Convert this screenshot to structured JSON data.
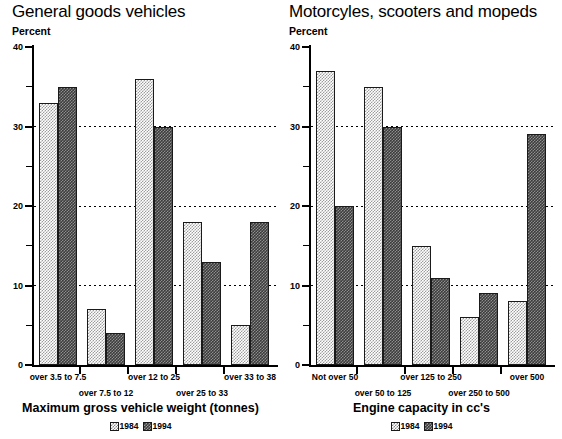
{
  "charts": [
    {
      "title": "General goods vehicles",
      "y_unit_label": "Percent",
      "axis_title": "Maximum gross vehicle weight (tonnes)",
      "legend": [
        {
          "label": "1984",
          "key": "y1984"
        },
        {
          "label": "1994",
          "key": "y1994"
        }
      ],
      "chart_data": {
        "type": "bar",
        "title": "General goods vehicles",
        "xlabel": "Maximum gross vehicle weight (tonnes)",
        "ylabel": "Percent",
        "ylim": [
          0,
          40
        ],
        "yticks": [
          0,
          10,
          20,
          30,
          40
        ],
        "yticks_minor": [
          5,
          15,
          25,
          35
        ],
        "grid": "horizontal-dotted",
        "legend_position": "bottom-center",
        "categories": [
          "over 3.5 to 7.5",
          "over 7.5 to 12",
          "over 12 to 25",
          "over 25 to 33",
          "over 33 to 38"
        ],
        "series": [
          {
            "name": "1984",
            "values": [
              33,
              7,
              36,
              18,
              5
            ]
          },
          {
            "name": "1994",
            "values": [
              35,
              4,
              30,
              13,
              18
            ]
          }
        ]
      }
    },
    {
      "title": "Motorcyles, scooters and mopeds",
      "y_unit_label": "Percent",
      "axis_title": "Engine capacity in cc's",
      "legend": [
        {
          "label": "1984",
          "key": "y1984"
        },
        {
          "label": "1994",
          "key": "y1994"
        }
      ],
      "chart_data": {
        "type": "bar",
        "title": "Motorcyles, scooters and mopeds",
        "xlabel": "Engine capacity in cc's",
        "ylabel": "Percent",
        "ylim": [
          0,
          40
        ],
        "yticks": [
          0,
          10,
          20,
          30,
          40
        ],
        "yticks_minor": [
          5,
          15,
          25,
          35
        ],
        "grid": "horizontal-dotted",
        "legend_position": "bottom-center",
        "categories": [
          "Not over 50",
          "over 50 to 125",
          "over 125 to 250",
          "over 250 to 500",
          "over 500"
        ],
        "series": [
          {
            "name": "1984",
            "values": [
              37,
              35,
              15,
              6,
              8
            ]
          },
          {
            "name": "1994",
            "values": [
              20,
              30,
              11,
              9,
              29
            ]
          }
        ]
      }
    }
  ]
}
